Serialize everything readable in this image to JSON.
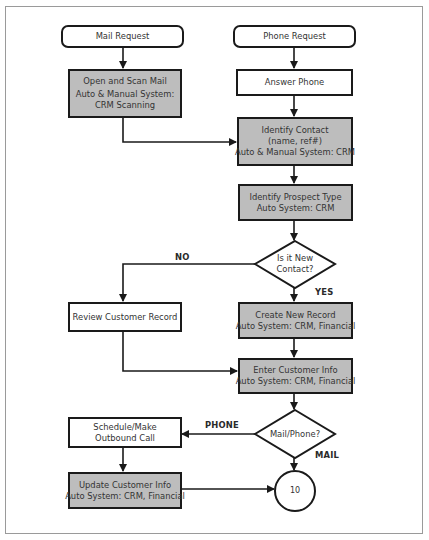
{
  "diagram": {
    "type": "flowchart",
    "colors": {
      "process_gray": "#bdbdbd",
      "line": "#1a1a1a",
      "frame": "#9a9a9a",
      "background": "#ffffff"
    },
    "nodes": {
      "mail_request": {
        "shape": "rounded-rect",
        "lines": [
          "Mail Request"
        ]
      },
      "phone_request": {
        "shape": "rounded-rect",
        "lines": [
          "Phone Request"
        ]
      },
      "open_scan_mail": {
        "shape": "rect-gray",
        "lines": [
          "Open and Scan Mail",
          "Auto & Manual System:",
          "CRM Scanning"
        ]
      },
      "answer_phone": {
        "shape": "rect",
        "lines": [
          "Answer Phone"
        ]
      },
      "identify_contact": {
        "shape": "rect-gray",
        "lines": [
          "Identify Contact",
          "(name, ref#)",
          "Auto & Manual System: CRM"
        ]
      },
      "identify_prospect": {
        "shape": "rect-gray",
        "lines": [
          "Identify Prospect Type",
          "Auto System: CRM"
        ]
      },
      "is_new_contact": {
        "shape": "diamond",
        "lines": [
          "Is it New",
          "Contact?"
        ]
      },
      "review_record": {
        "shape": "rect",
        "lines": [
          "Review Customer Record"
        ]
      },
      "create_record": {
        "shape": "rect-gray",
        "lines": [
          "Create New Record",
          "Auto System: CRM, Financial"
        ]
      },
      "enter_info": {
        "shape": "rect-gray",
        "lines": [
          "Enter Customer Info",
          "Auto System: CRM, Financial"
        ]
      },
      "mail_phone": {
        "shape": "diamond",
        "lines": [
          "Mail/Phone?"
        ]
      },
      "schedule_call": {
        "shape": "rect",
        "lines": [
          "Schedule/Make",
          "Outbound Call"
        ]
      },
      "update_info": {
        "shape": "rect-gray",
        "lines": [
          "Update Customer Info",
          "Auto System: CRM, Financial"
        ]
      },
      "connector_10": {
        "shape": "circle",
        "label": "10"
      }
    },
    "edge_labels": {
      "no": "NO",
      "yes": "YES",
      "phone": "PHONE",
      "mail": "MAIL"
    },
    "edges": [
      {
        "from": "mail_request",
        "to": "open_scan_mail"
      },
      {
        "from": "phone_request",
        "to": "answer_phone"
      },
      {
        "from": "answer_phone",
        "to": "identify_contact"
      },
      {
        "from": "open_scan_mail",
        "to": "identify_contact"
      },
      {
        "from": "identify_contact",
        "to": "identify_prospect"
      },
      {
        "from": "identify_prospect",
        "to": "is_new_contact"
      },
      {
        "from": "is_new_contact",
        "to": "review_record",
        "label": "NO"
      },
      {
        "from": "is_new_contact",
        "to": "create_record",
        "label": "YES"
      },
      {
        "from": "create_record",
        "to": "enter_info"
      },
      {
        "from": "review_record",
        "to": "enter_info"
      },
      {
        "from": "enter_info",
        "to": "mail_phone"
      },
      {
        "from": "mail_phone",
        "to": "schedule_call",
        "label": "PHONE"
      },
      {
        "from": "mail_phone",
        "to": "connector_10",
        "label": "MAIL"
      },
      {
        "from": "schedule_call",
        "to": "update_info"
      },
      {
        "from": "update_info",
        "to": "connector_10"
      }
    ]
  }
}
